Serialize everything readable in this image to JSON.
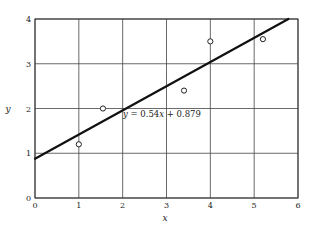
{
  "chart_data": {
    "type": "scatter",
    "title": "",
    "xlabel": "x",
    "ylabel": "y",
    "xlim": [
      0,
      6
    ],
    "ylim": [
      0,
      4
    ],
    "xticks": [
      "0",
      "1",
      "2",
      "3",
      "4",
      "5",
      "6"
    ],
    "yticks": [
      "0",
      "1",
      "2",
      "3",
      "4"
    ],
    "grid": true,
    "legend": null,
    "series": [
      {
        "name": "observations",
        "marker": "open-circle",
        "points": [
          {
            "x": 1.0,
            "y": 1.2
          },
          {
            "x": 1.55,
            "y": 2.0
          },
          {
            "x": 3.4,
            "y": 2.4
          },
          {
            "x": 4.0,
            "y": 3.5
          },
          {
            "x": 5.2,
            "y": 3.55
          }
        ]
      },
      {
        "name": "fit line",
        "type": "line",
        "slope": 0.54,
        "intercept": 0.879,
        "x_range": [
          0,
          5.78
        ]
      }
    ],
    "annotations": [
      {
        "text": "y = 0.54x + 0.879",
        "x": 2.05,
        "y": 1.82
      }
    ]
  },
  "labels": {
    "x_axis": "x",
    "y_axis": "y",
    "equation_lhs": "y",
    "equation_mid": " = 0.54",
    "equation_x": "x",
    "equation_rhs": " + 0.879"
  },
  "colors": {
    "line": "#111111",
    "grid": "#444444",
    "marker": "#222222"
  }
}
